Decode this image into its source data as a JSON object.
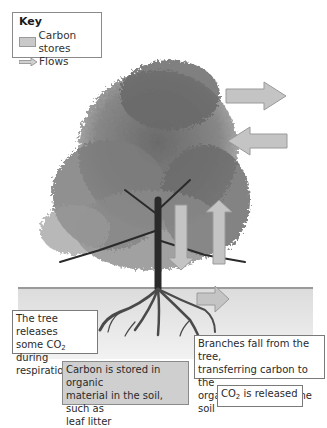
{
  "key": {
    "title": "Key",
    "items": [
      {
        "label": "Carbon stores",
        "icon": "grey-box"
      },
      {
        "label": "Flows",
        "icon": "arrow-right"
      }
    ]
  },
  "labels": {
    "respiration": {
      "line1": "The tree releases",
      "line2a": "some CO",
      "line2sub": "2",
      "line2b": " during",
      "line3": "respiration"
    },
    "branches": {
      "line1": "Branches fall from the tree,",
      "line2": "transferring carbon to the",
      "line3": "organic material in the soil"
    },
    "soil_store": {
      "line1": "Carbon is stored in organic",
      "line2": "material in the soil, such as",
      "line3": "leaf litter"
    },
    "co2_released": {
      "a": "CO",
      "sub": "2",
      "b": " is released"
    }
  },
  "colors": {
    "arrow_fill": "#c4c4c4",
    "arrow_stroke": "#9a9a9a",
    "ground": "#e4e4e4",
    "store_box": "#cfcfcf"
  }
}
